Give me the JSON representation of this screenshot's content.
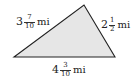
{
  "diagram": {
    "shape": "triangle",
    "fill_color": "#e6e6e6",
    "stroke_color": "#222222",
    "vertices": [
      [
        14,
        57
      ],
      [
        84,
        5
      ],
      [
        115,
        57
      ]
    ],
    "sides": {
      "left": {
        "whole": "3",
        "numerator": "7",
        "denominator": "10",
        "unit": "mi"
      },
      "right": {
        "whole": "2",
        "numerator": "1",
        "denominator": "2",
        "unit": "mi"
      },
      "bottom": {
        "whole": "4",
        "numerator": "3",
        "denominator": "10",
        "unit": "mi"
      }
    }
  }
}
